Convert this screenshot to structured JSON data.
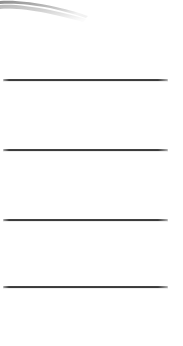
{
  "page": {
    "width": 183,
    "height": 346,
    "background_color": "#ffffff"
  },
  "artifact": {
    "name": "scan-shadow-artifact",
    "shape": "curved grey ribbon / page-edge shadow",
    "x": 0,
    "y": 0,
    "width": 92,
    "height": 26,
    "color_dark": "#8e8e8e",
    "color_mid": "#b4b4b4",
    "color_light": "#dcdcdc"
  },
  "rules": [
    {
      "label": "rule-1",
      "x": 3,
      "y": 79,
      "width": 165,
      "thickness": 2,
      "color": "#2f2f2f"
    },
    {
      "label": "rule-2",
      "x": 3,
      "y": 149,
      "width": 165,
      "thickness": 2,
      "color": "#2f2f2f"
    },
    {
      "label": "rule-3",
      "x": 3,
      "y": 219,
      "width": 165,
      "thickness": 2,
      "color": "#2f2f2f"
    },
    {
      "label": "rule-4",
      "x": 3,
      "y": 286,
      "width": 165,
      "thickness": 2,
      "color": "#2f2f2f"
    }
  ]
}
